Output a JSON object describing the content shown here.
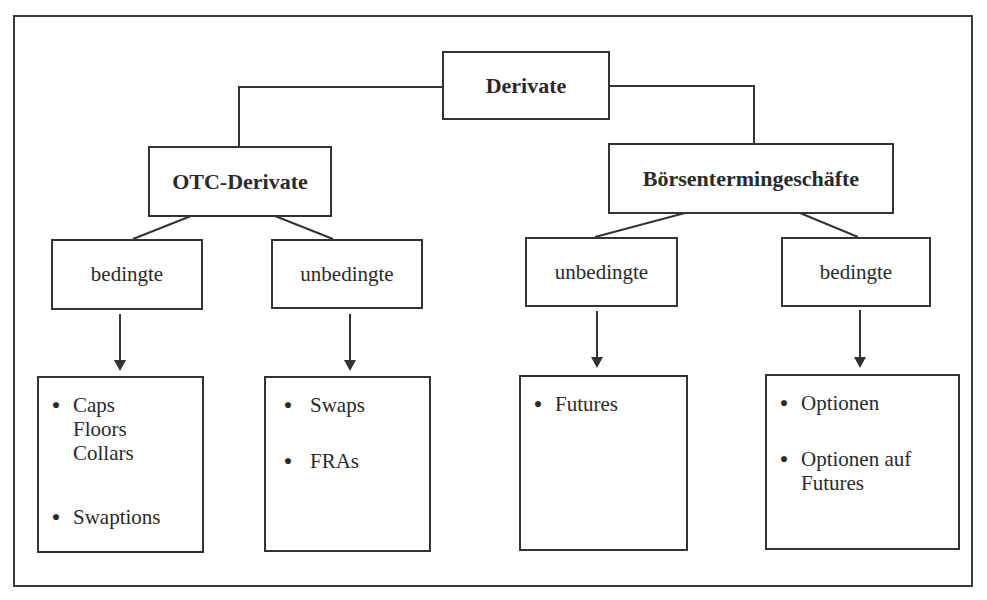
{
  "diagram": {
    "root": {
      "label": "Derivate"
    },
    "branches": [
      {
        "label": "OTC-Derivate",
        "children": [
          {
            "label": "bedingte",
            "items": [
              [
                "Caps",
                "Floors",
                "Collars"
              ],
              [
                "Swaptions"
              ]
            ]
          },
          {
            "label": "unbedingte",
            "items": [
              [
                "Swaps"
              ],
              [
                "FRAs"
              ]
            ]
          }
        ]
      },
      {
        "label": "Börsentermingeschäfte",
        "children": [
          {
            "label": "unbedingte",
            "items": [
              [
                "Futures"
              ]
            ]
          },
          {
            "label": "bedingte",
            "items": [
              [
                "Optionen"
              ],
              [
                "Optionen auf",
                "Futures"
              ]
            ]
          }
        ]
      }
    ],
    "bullet_symbol": "●",
    "colors": {
      "line": "#333333",
      "text": "#2a2a2a",
      "background": "#ffffff"
    }
  }
}
